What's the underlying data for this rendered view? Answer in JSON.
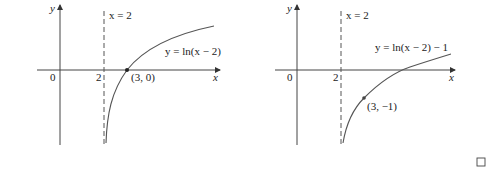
{
  "figure_left": {
    "y_axis_label": "y",
    "x_axis_label": "x",
    "origin_label": "0",
    "tick_label_2": "2",
    "asymptote_label": "x = 2",
    "curve_label": "y = ln(x − 2)",
    "point_label": "(3, 0)"
  },
  "figure_right": {
    "y_axis_label": "y",
    "x_axis_label": "x",
    "origin_label": "0",
    "tick_label_2": "2",
    "asymptote_label": "x = 2",
    "curve_label": "y = ln(x − 2) − 1",
    "point_label": "(3, −1)"
  },
  "end_mark": "□",
  "colors": {
    "axis": "#444444",
    "curve": "#555555",
    "text": "#222222"
  }
}
